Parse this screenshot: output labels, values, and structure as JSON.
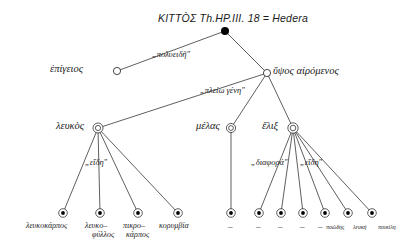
{
  "figure": {
    "title": "ΚΙΤΤÒΣ   Th.HP.III. 18 = Hedera",
    "root_label": "ΚΙΤΤÒΣ",
    "reference": "Th.HP.III. 18 = Hedera"
  },
  "edge_labels": {
    "level1": "„πολυειδῆ\"",
    "level2": "„πλείω γένη\"",
    "left_species": "„εἴδη\"",
    "right_species_a": "„διαφορά\"",
    "right_species_b": "„εἴδη\""
  },
  "nodes": {
    "epigeios": "ἐπίγειος",
    "hypsos": "ὕψος  αἰρόμενος",
    "leukos": "λευκὸς",
    "melas": "μέλας",
    "helix": "ἕλιξ"
  },
  "leaves": {
    "leukos_children": [
      "λευκοκάρπος",
      "λευκο–\nφύλλος",
      "πικρο–\nκάρπος",
      "κορυμβία"
    ],
    "leukos_children_line1": [
      "λευκοκάρπος",
      "λευκο–",
      "πικρο–",
      "κορυμβία"
    ],
    "leukos_children_line2": [
      "",
      "φύλλος",
      "κάρπος",
      ""
    ],
    "melas_children": [
      "–"
    ],
    "helix_children": [
      "–",
      "–",
      "–",
      "–",
      "ποώδης",
      "λευκή",
      "ποικίλη"
    ]
  },
  "colors": {
    "stroke": "#1a1a1a",
    "fill_root": "#000000",
    "background": "#ffffff"
  }
}
